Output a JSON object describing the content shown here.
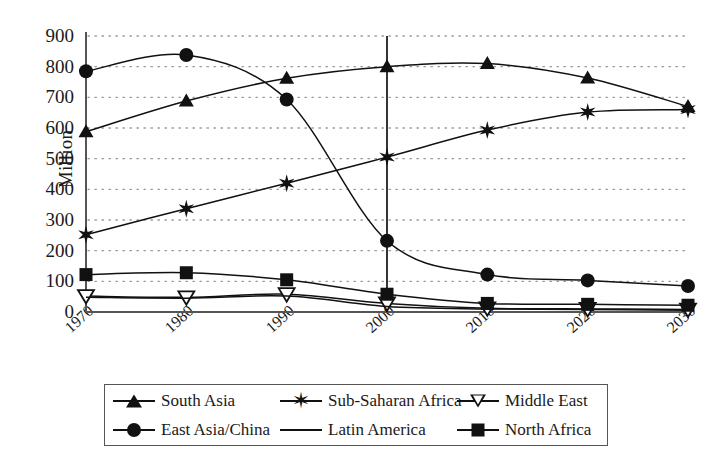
{
  "chart_data": {
    "type": "line",
    "title": "",
    "xlabel": "",
    "ylabel": "Million",
    "categories": [
      1970,
      1980,
      1990,
      2000,
      2010,
      2020,
      2030
    ],
    "xtick_labels": [
      "1970",
      "1980",
      "1990",
      "2000",
      "2010",
      "2020",
      "2030"
    ],
    "ytick_labels": [
      "900",
      "800",
      "700",
      "600",
      "500",
      "400",
      "300",
      "200",
      "100",
      "0"
    ],
    "ylim": [
      0,
      900
    ],
    "ytick_step": 100,
    "grid": "horizontal-dotted",
    "legend_position": "bottom",
    "annotations": [
      {
        "type": "vertical-reference-line",
        "x": 2000,
        "from": 0,
        "to": 900
      }
    ],
    "series": [
      {
        "name": "South Asia",
        "marker": "filled-triangle-up",
        "values": [
          588,
          688,
          762,
          800,
          810,
          763,
          670
        ]
      },
      {
        "name": "Sub-Saharan Africa",
        "marker": "star",
        "values": [
          252,
          337,
          420,
          505,
          593,
          652,
          660
        ]
      },
      {
        "name": "Middle East",
        "marker": "open-triangle-down",
        "values": [
          52,
          48,
          58,
          28,
          12,
          10,
          8
        ]
      },
      {
        "name": "East Asia/China",
        "marker": "filled-circle",
        "values": [
          785,
          838,
          693,
          232,
          122,
          103,
          85
        ]
      },
      {
        "name": "Latin America",
        "marker": "none",
        "values": [
          48,
          45,
          52,
          18,
          10,
          8,
          6
        ]
      },
      {
        "name": "North Africa",
        "marker": "filled-square",
        "values": [
          122,
          128,
          105,
          58,
          28,
          25,
          22
        ]
      }
    ]
  },
  "legend": {
    "items": [
      {
        "label": "South Asia",
        "marker": "filled-triangle-up"
      },
      {
        "label": "Sub-Saharan Africa",
        "marker": "star"
      },
      {
        "label": "Middle East",
        "marker": "open-triangle-down"
      },
      {
        "label": "East Asia/China",
        "marker": "filled-circle"
      },
      {
        "label": "Latin America",
        "marker": "none"
      },
      {
        "label": "North Africa",
        "marker": "filled-square"
      }
    ]
  },
  "colors": {
    "line": "#111111",
    "grid": "#9a9a9a",
    "axis": "#555555",
    "text": "#1a1a1a"
  }
}
